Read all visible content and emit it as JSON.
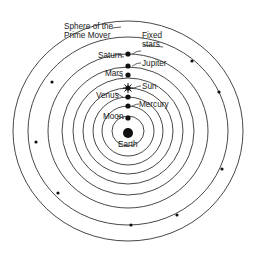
{
  "diagram": {
    "center": {
      "x": 128,
      "y": 131
    },
    "colors": {
      "line": "#333333",
      "text": "#222222",
      "background": "#ffffff",
      "dot": "#111111"
    },
    "earth": {
      "label": "Earth"
    },
    "spheres": [
      {
        "id": "moon",
        "label": "Moon",
        "r": 15
      },
      {
        "id": "mercury",
        "label": "Mercury",
        "r": 25
      },
      {
        "id": "venus",
        "label": "Venus",
        "r": 34
      },
      {
        "id": "sun",
        "label": "Sun",
        "r": 43
      },
      {
        "id": "mars",
        "label": "Mars",
        "r": 53
      },
      {
        "id": "jupiter",
        "label": "Jupiter",
        "r": 64
      },
      {
        "id": "saturn",
        "label": "Saturn",
        "r": 77
      },
      {
        "id": "fixed-stars",
        "label_line1": "Fixed",
        "label_line2": "stars",
        "r": 94
      },
      {
        "id": "prime-mover",
        "label_line1": "Sphere of the",
        "label_line2": "Prime Mover",
        "r": 110
      }
    ]
  }
}
